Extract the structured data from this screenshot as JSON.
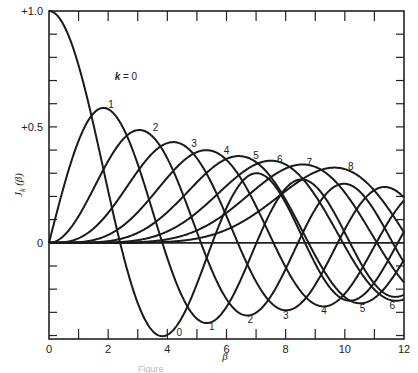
{
  "chart_data": {
    "type": "line",
    "title": "",
    "xlabel": "β",
    "ylabel": "J_k(β)",
    "xlim": [
      0,
      12
    ],
    "ylim": [
      -0.415,
      1.0
    ],
    "grid": false,
    "x_ticks": [
      0,
      2,
      4,
      6,
      8,
      10,
      12
    ],
    "x_minor_ticks": [
      1,
      3,
      5,
      7,
      9,
      11
    ],
    "y_ticks": [
      {
        "value": 1.0,
        "label": "+1.0"
      },
      {
        "value": 0.5,
        "label": "+0.5"
      },
      {
        "value": 0.0,
        "label": "0"
      }
    ],
    "y_minor_step": 0.1,
    "series_function": "Bessel function of the first kind J_k(β)",
    "series": [
      {
        "name": "k = 0",
        "k": 0
      },
      {
        "name": "1",
        "k": 1
      },
      {
        "name": "2",
        "k": 2
      },
      {
        "name": "3",
        "k": 3
      },
      {
        "name": "4",
        "k": 4
      },
      {
        "name": "5",
        "k": 5
      },
      {
        "name": "6",
        "k": 6
      },
      {
        "name": "7",
        "k": 7
      },
      {
        "name": "8",
        "k": 8
      }
    ],
    "sample_points": {
      "x": [
        0,
        1,
        2,
        3,
        4,
        5,
        6,
        7,
        8,
        9,
        10,
        11,
        12
      ],
      "k0": [
        1.0,
        0.765,
        0.224,
        -0.26,
        -0.397,
        -0.178,
        0.151,
        0.3,
        0.172,
        -0.09,
        -0.246,
        -0.171,
        0.048
      ],
      "k1": [
        0.0,
        0.44,
        0.577,
        0.339,
        -0.066,
        -0.328,
        -0.277,
        -0.005,
        0.235,
        0.245,
        0.043,
        -0.177,
        -0.223
      ],
      "k2": [
        0.0,
        0.115,
        0.353,
        0.486,
        0.364,
        0.047,
        -0.243,
        -0.301,
        -0.113,
        0.145,
        0.255,
        0.139,
        -0.085
      ]
    },
    "annotations": [
      {
        "text": "k = 0",
        "x": 2.6,
        "y": 0.72
      },
      {
        "text": "1",
        "x": 2.1,
        "y": 0.6,
        "position": "peak"
      },
      {
        "text": "2",
        "x": 3.6,
        "y": 0.5
      },
      {
        "text": "3",
        "x": 4.9,
        "y": 0.43
      },
      {
        "text": "4",
        "x": 6.0,
        "y": 0.4
      },
      {
        "text": "5",
        "x": 7.0,
        "y": 0.38
      },
      {
        "text": "6",
        "x": 7.8,
        "y": 0.36
      },
      {
        "text": "7",
        "x": 8.8,
        "y": 0.35
      },
      {
        "text": "8",
        "x": 10.2,
        "y": 0.33
      },
      {
        "text": "0",
        "x": 4.4,
        "y": -0.385,
        "position": "trough"
      },
      {
        "text": "1",
        "x": 5.5,
        "y": -0.36
      },
      {
        "text": "2",
        "x": 6.8,
        "y": -0.33
      },
      {
        "text": "3",
        "x": 8.0,
        "y": -0.31
      },
      {
        "text": "4",
        "x": 9.3,
        "y": -0.29
      },
      {
        "text": "5",
        "x": 10.6,
        "y": -0.28
      },
      {
        "text": "6",
        "x": 11.6,
        "y": -0.27
      }
    ]
  },
  "figure": {
    "caption": "Figure"
  }
}
